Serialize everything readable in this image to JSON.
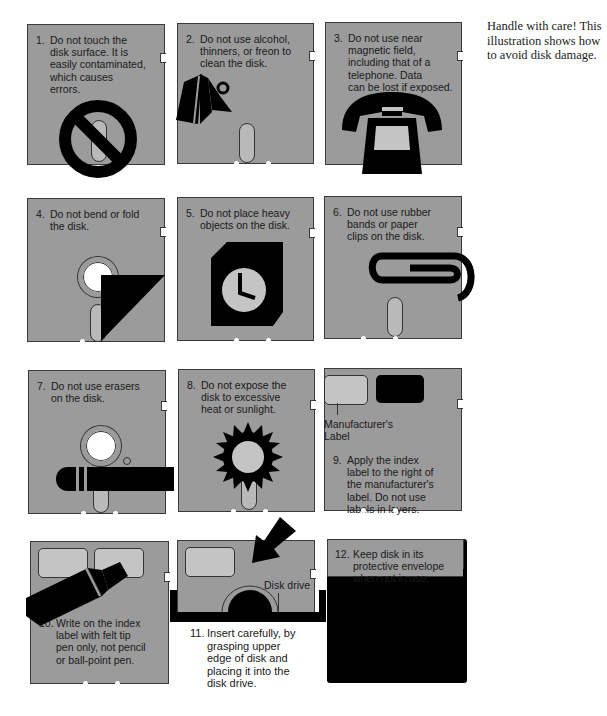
{
  "caption": "Handle with care! This illustration shows how to avoid disk damage.",
  "colors": {
    "disk_gray": "#9b9b9b",
    "slot_gray": "#b9b9b9",
    "ink": "#000000",
    "background": "#ffffff"
  },
  "panels": [
    {
      "num": "1.",
      "text": "Do not touch the\ndisk surface. It is\neasily contaminated,\nwhich causes\nerrors.",
      "icon": "no-touch-prohibition-icon"
    },
    {
      "num": "2.",
      "text": "Do not use alcohol,\nthinners, or freon to\nclean the disk.",
      "icon": "solvent-bottle-icon"
    },
    {
      "num": "3.",
      "text": "Do not use near\nmagnetic field,\nincluding that of a\ntelephone. Data\ncan be lost if exposed.",
      "icon": "telephone-icon"
    },
    {
      "num": "4.",
      "text": "Do not bend or fold\nthe disk.",
      "icon": "folded-corner-icon"
    },
    {
      "num": "5.",
      "text": "Do not place heavy\nobjects on the disk.",
      "icon": "heavy-clock-icon"
    },
    {
      "num": "6.",
      "text": "Do not use rubber\nbands or paper\nclips on the disk.",
      "icon": "paper-clip-icon"
    },
    {
      "num": "7.",
      "text": "Do not use erasers\non the disk.",
      "icon": "eraser-icon"
    },
    {
      "num": "8.",
      "text": "Do not expose the\ndisk to excessive\nheat or sunlight.",
      "icon": "sun-icon"
    },
    {
      "num": "9.",
      "text": "Apply the index\nlabel to the right of\nthe manufacturer's\nlabel. Do not use\nlabels in layers.",
      "icon": "labels-icon",
      "sublabel": "Manufacturer's\nLabel"
    },
    {
      "num": "10.",
      "text": "Write on the index\nlabel with felt tip\npen only, not pencil\nor ball-point pen.",
      "icon": "felt-tip-pen-icon"
    },
    {
      "num": "11.",
      "text": "Insert carefully, by\ngrasping upper\nedge of disk and\nplacing it into the\ndisk drive.",
      "icon": "insert-arrow-icon",
      "sublabel": "Disk drive"
    },
    {
      "num": "12.",
      "text": "Keep disk in its\nprotective envelope\nwhen not in use.",
      "icon": "envelope-icon"
    }
  ]
}
